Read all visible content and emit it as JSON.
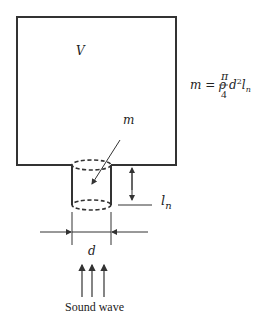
{
  "diagram": {
    "labels": {
      "volume": "V",
      "mass": "m",
      "neck_length": "l",
      "neck_length_sub": "n",
      "diameter": "d",
      "sound_wave": "Sound wave"
    },
    "formula": {
      "lhs": "m = ρ",
      "numerator": "π",
      "denominator": "4",
      "rhs_d": "d",
      "rhs_sup": "2",
      "rhs_l": "l",
      "rhs_sub": "n"
    },
    "colors": {
      "stroke": "#333333",
      "text": "#222222"
    }
  }
}
